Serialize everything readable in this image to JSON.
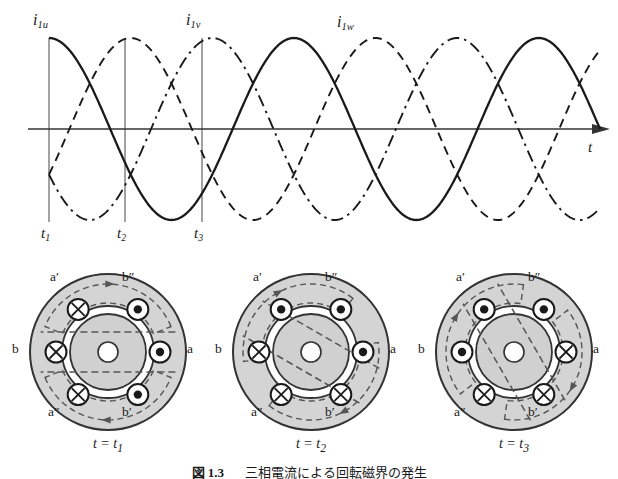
{
  "figure": {
    "caption_number": "図 1.3",
    "caption_text": "三相電流による回転磁界の発生",
    "caption_full": "図 1.3　三相電流による回転磁界の発生"
  },
  "waveform": {
    "axis_label_t": "t",
    "curve_labels": [
      {
        "base": "i",
        "sub": "1u",
        "style": "solid"
      },
      {
        "base": "i",
        "sub": "1v",
        "style": "dashed"
      },
      {
        "base": "i",
        "sub": "1w",
        "style": "dashdot"
      }
    ],
    "time_markers": [
      {
        "base": "t",
        "sub": "1"
      },
      {
        "base": "t",
        "sub": "2"
      },
      {
        "base": "t",
        "sub": "3"
      }
    ]
  },
  "chart_data": {
    "type": "line",
    "title": "",
    "xlabel": "t",
    "ylabel": "",
    "grid": false,
    "legend": "inline-labels",
    "x_range_deg": [
      0,
      810
    ],
    "ylim": [
      -1,
      1
    ],
    "series": [
      {
        "name": "i_1u",
        "label": "i1u",
        "phase_deg": 90,
        "style": "solid",
        "values_at_markers": [
          1.0,
          0.5,
          0.0
        ]
      },
      {
        "name": "i_1v",
        "label": "i1v",
        "phase_deg": -30,
        "style": "dashed",
        "values_at_markers": [
          -0.5,
          0.5,
          1.0
        ]
      },
      {
        "name": "i_1w",
        "label": "i1w",
        "phase_deg": -150,
        "style": "dashdot",
        "values_at_markers": [
          -0.5,
          -1.0,
          -0.5
        ]
      }
    ],
    "markers_deg": [
      0,
      60,
      120
    ],
    "marker_labels": [
      "t1",
      "t2",
      "t3"
    ]
  },
  "cross_sections": [
    {
      "id": "t1",
      "caption": "t = t",
      "caption_sub": "1",
      "field_angle_deg": 0,
      "coil_labels": {
        "top_left": "a′",
        "top_right": "b″",
        "left": "b",
        "right": "a",
        "bottom_left": "a″",
        "bottom_right": "b′"
      },
      "conductors": [
        {
          "pos": "top-left",
          "current": "in"
        },
        {
          "pos": "top-right",
          "current": "out"
        },
        {
          "pos": "left",
          "current": "in"
        },
        {
          "pos": "right",
          "current": "out"
        },
        {
          "pos": "bottom-left",
          "current": "in"
        },
        {
          "pos": "bottom-right",
          "current": "out"
        }
      ]
    },
    {
      "id": "t2",
      "caption": "t = t",
      "caption_sub": "2",
      "field_angle_deg": 30,
      "coil_labels": {
        "top_left": "a′",
        "top_right": "b″",
        "left": "b",
        "right": "a",
        "bottom_left": "a″",
        "bottom_right": "b′"
      },
      "conductors": [
        {
          "pos": "top-left",
          "current": "out"
        },
        {
          "pos": "top-right",
          "current": "out"
        },
        {
          "pos": "left",
          "current": "in"
        },
        {
          "pos": "right",
          "current": "out"
        },
        {
          "pos": "bottom-left",
          "current": "in"
        },
        {
          "pos": "bottom-right",
          "current": "in"
        }
      ]
    },
    {
      "id": "t3",
      "caption": "t = t",
      "caption_sub": "3",
      "field_angle_deg": 60,
      "coil_labels": {
        "top_left": "a′",
        "top_right": "b″",
        "left": "b",
        "right": "a",
        "bottom_left": "a″",
        "bottom_right": "b′"
      },
      "conductors": [
        {
          "pos": "top-left",
          "current": "out"
        },
        {
          "pos": "top-right",
          "current": "out"
        },
        {
          "pos": "left",
          "current": "out"
        },
        {
          "pos": "right",
          "current": "in"
        },
        {
          "pos": "bottom-left",
          "current": "in"
        },
        {
          "pos": "bottom-right",
          "current": "in"
        }
      ]
    }
  ],
  "symbols": {
    "current_into_page": "⊗",
    "current_out_of_page": "⊙"
  },
  "colors": {
    "ink": "#1a1a1a",
    "stroke": "#333333",
    "stator_fill": "#d4d4d4",
    "rotor_fill": "#d0d0d0",
    "gap_fill": "#ffffff",
    "flux_line": "#555555",
    "background": "#ffffff"
  }
}
